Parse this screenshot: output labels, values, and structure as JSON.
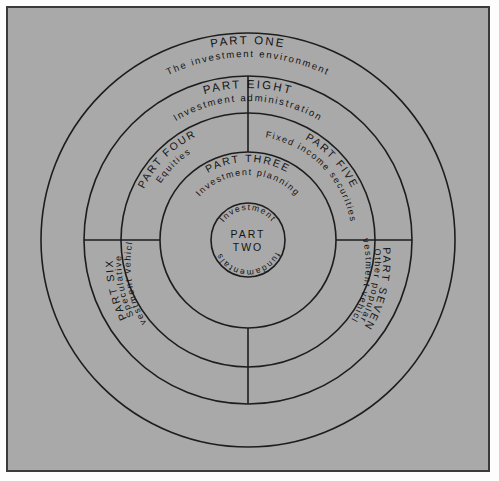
{
  "figure": {
    "background_color": "#a9a9a9",
    "frame_color": "#3b3b3b",
    "line_color": "#1d1d1d",
    "text_color": "#141414"
  },
  "geometry": {
    "center_x": 248,
    "center_y": 240,
    "radii": [
      37,
      88,
      127,
      164,
      207
    ]
  },
  "rings": {
    "ring_one": {
      "heading": "PART ONE",
      "subtitle": "The investment environment"
    },
    "ring_eight": {
      "heading": "PART EIGHT",
      "subtitle": "Investment administration"
    },
    "ring_four": {
      "heading": "PART FOUR",
      "subtitle": "Equities"
    },
    "ring_five": {
      "heading": "PART FIVE",
      "subtitle": "Fixed income securities"
    },
    "ring_six": {
      "heading": "PART SIX",
      "subtitle_line1": "Speculative",
      "subtitle_line2": "investment vehicles"
    },
    "ring_seven": {
      "heading": "PART SEVEN",
      "subtitle_line1": "Other popular",
      "subtitle_line2": "investment vehicles"
    },
    "ring_three": {
      "heading": "PART THREE",
      "subtitle": "Investment planning"
    },
    "ring_two": {
      "heading_line1": "PART",
      "heading_line2": "TWO",
      "arc_top": "Investment",
      "arc_bottom": "fundamentals"
    }
  }
}
